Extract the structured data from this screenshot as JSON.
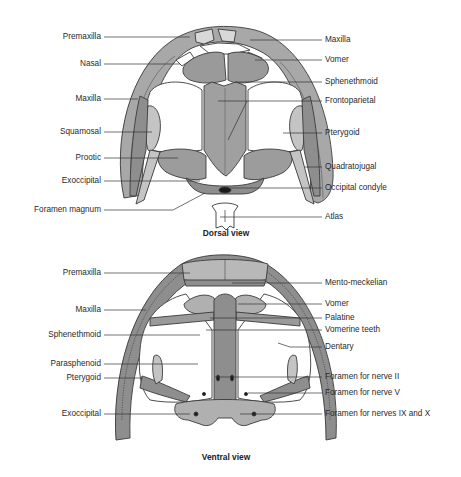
{
  "colors": {
    "bone_dark": "#8e8e8e",
    "bone_mid": "#a8a8a8",
    "bone_light": "#c4c4c4",
    "bone_pale": "#d8d8d8",
    "outline": "#3a3a3a",
    "leader_line": "#333333",
    "text": "#2a2a2a"
  },
  "dorsal": {
    "caption": "Dorsal view",
    "left_labels": [
      {
        "text": "Premaxilla",
        "y": 37,
        "x_end": 190
      },
      {
        "text": "Nasal",
        "y": 64,
        "x_end": 180
      },
      {
        "text": "Maxilla",
        "y": 99,
        "x_end": 138
      },
      {
        "text": "Squamosal",
        "y": 132,
        "x_end": 152
      },
      {
        "text": "Prootic",
        "y": 158,
        "x_end": 178
      },
      {
        "text": "Exoccipital",
        "y": 181,
        "x_end": 200
      },
      {
        "text": "Foramen magnum",
        "y": 210,
        "x_end": 173
      }
    ],
    "right_labels": [
      {
        "text": "Maxilla",
        "y": 40,
        "x_start": 250
      },
      {
        "text": "Vomer",
        "y": 60,
        "x_start": 255
      },
      {
        "text": "Sphenethmoid",
        "y": 82,
        "x_start": 235
      },
      {
        "text": "Frontoparietal",
        "y": 101,
        "x_start": 218
      },
      {
        "text": "Pterygoid",
        "y": 133,
        "x_start": 283
      },
      {
        "text": "Quadratojugal",
        "y": 167,
        "x_start": 305
      },
      {
        "text": "Occipital condyle",
        "y": 188,
        "x_start": 230
      },
      {
        "text": "Atlas",
        "y": 217,
        "x_start": 220
      }
    ]
  },
  "ventral": {
    "caption": "Ventral view",
    "left_labels": [
      {
        "text": "Premaxilla",
        "y": 273,
        "x_end": 190
      },
      {
        "text": "Maxilla",
        "y": 310,
        "x_end": 146
      },
      {
        "text": "Sphenethmoid",
        "y": 335,
        "x_end": 200
      },
      {
        "text": "Parasphenoid",
        "y": 364,
        "x_end": 198
      },
      {
        "text": "Pterygoid",
        "y": 378,
        "x_end": 143
      },
      {
        "text": "Exoccipital",
        "y": 414,
        "x_end": 190
      }
    ],
    "right_labels": [
      {
        "text": "Mento-meckelian",
        "y": 283,
        "x_start": 232
      },
      {
        "text": "Vomer",
        "y": 304,
        "x_start": 238
      },
      {
        "text": "Palatine",
        "y": 318,
        "x_start": 210
      },
      {
        "text": "Vomerine teeth",
        "y": 330,
        "x_start": 206
      },
      {
        "text": "Dentary",
        "y": 347,
        "x_start": 290
      },
      {
        "text": "Foramen for nerve II",
        "y": 377,
        "x_start": 215
      },
      {
        "text": "Foramen for nerve V",
        "y": 393,
        "x_start": 248
      },
      {
        "text": "Foramen for nerves IX and X",
        "y": 414,
        "x_start": 240
      }
    ]
  }
}
